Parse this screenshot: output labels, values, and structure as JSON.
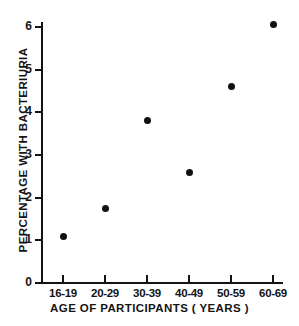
{
  "chart_data": {
    "type": "scatter",
    "title": "",
    "xlabel": "AGE OF PARTICIPANTS ( YEARS )",
    "ylabel": "PERCENTAGE  WITH  BACTERIURIA",
    "categories": [
      "16-19",
      "20-29",
      "30-39",
      "40-49",
      "50-59",
      "60-69"
    ],
    "values": [
      1.1,
      1.75,
      3.8,
      2.6,
      4.6,
      6.05
    ],
    "series": [
      {
        "name": "Percentage with bacteriuria",
        "values": [
          1.1,
          1.75,
          3.8,
          2.6,
          4.6,
          6.05
        ]
      }
    ],
    "points": [
      {
        "category": "16-19",
        "value": 1.1
      },
      {
        "category": "20-29",
        "value": 1.75
      },
      {
        "category": "30-39",
        "value": 3.8
      },
      {
        "category": "40-49",
        "value": 2.6
      },
      {
        "category": "50-59",
        "value": 4.6
      },
      {
        "category": "60-69",
        "value": 6.05
      }
    ],
    "ylim": [
      0,
      6.4
    ],
    "y_ticks": [
      "0",
      "1",
      "2",
      "3",
      "4",
      "5",
      "6"
    ],
    "y_tick_values": [
      0,
      1,
      2,
      3,
      4,
      5,
      6
    ],
    "x_ticks": [
      "16-19",
      "20-29",
      "30-39",
      "40-49",
      "50-59",
      "60-69"
    ],
    "grid": false,
    "legend": null,
    "marker": "filled-circle",
    "marker_color": "#111111",
    "axis_color": "#141414",
    "background_color": "#ffffff"
  },
  "axes": {
    "y_title": "PERCENTAGE  WITH  BACTERIURIA",
    "x_title": "AGE OF PARTICIPANTS ( YEARS )",
    "y_labels": {
      "0": "0",
      "1": "1",
      "2": "2",
      "3": "3",
      "4": "4",
      "5": "5",
      "6": "6"
    },
    "x_labels": {
      "0": "16-19",
      "1": "20-29",
      "2": "30-39",
      "3": "40-49",
      "4": "50-59",
      "5": "60-69"
    }
  }
}
